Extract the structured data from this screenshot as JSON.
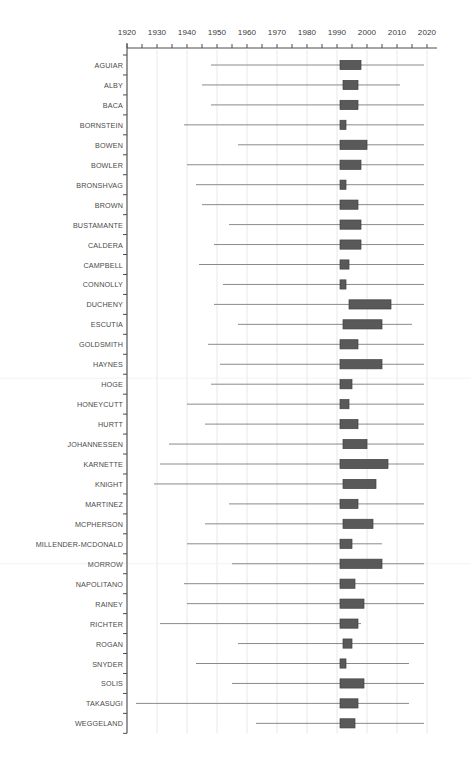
{
  "figure": {
    "title": "",
    "type_note": "box-and-whisker strip chart",
    "axis": {
      "x_label": "",
      "x_ticks": [
        1920,
        1930,
        1940,
        1950,
        1960,
        1970,
        1980,
        1990,
        2000,
        2010,
        2020
      ],
      "x_minor_step": 5,
      "x_min": 1920,
      "x_max": 2025,
      "grid": "vertical light gray at major ticks",
      "tick_position": "top"
    },
    "colors": {
      "box_fill": "#595959",
      "box_edge": "#404040",
      "whisker": "#8a8a8a",
      "axis": "#4d4d4d",
      "grid": "#e2e2e2",
      "label_text": "#4a4a4a",
      "tick_text": "#3a3a3a"
    }
  },
  "chart_data": {
    "type": "box",
    "title": "",
    "xlabel": "",
    "ylabel": "",
    "xlim": [
      1920,
      2025
    ],
    "grid": true,
    "legend": "none",
    "categories": [
      "AGUIAR",
      "ALBY",
      "BACA",
      "BORNSTEIN",
      "BOWEN",
      "BOWLER",
      "BRONSHVAG",
      "BROWN",
      "BUSTAMANTE",
      "CALDERA",
      "CAMPBELL",
      "CONNOLLY",
      "DUCHENY",
      "ESCUTIA",
      "GOLDSMITH",
      "HAYNES",
      "HOGE",
      "HONEYCUTT",
      "HURTT",
      "JOHANNESSEN",
      "KARNETTE",
      "KNIGHT",
      "MARTINEZ",
      "MCPHERSON",
      "MILLENDER-MCDONALD",
      "MORROW",
      "NAPOLITANO",
      "RAINEY",
      "RICHTER",
      "ROGAN",
      "SNYDER",
      "SOLIS",
      "TAKASUGI",
      "WEGGELAND"
    ],
    "boxes": [
      {
        "label": "AGUIAR",
        "whisker_low": 1948,
        "box_low": 1991,
        "box_high": 1998,
        "whisker_high": 2019
      },
      {
        "label": "ALBY",
        "whisker_low": 1945,
        "box_low": 1992,
        "box_high": 1997,
        "whisker_high": 2011
      },
      {
        "label": "BACA",
        "whisker_low": 1948,
        "box_low": 1991,
        "box_high": 1997,
        "whisker_high": 2019
      },
      {
        "label": "BORNSTEIN",
        "whisker_low": 1939,
        "box_low": 1991,
        "box_high": 1993,
        "whisker_high": 2019
      },
      {
        "label": "BOWEN",
        "whisker_low": 1957,
        "box_low": 1991,
        "box_high": 2000,
        "whisker_high": 2019
      },
      {
        "label": "BOWLER",
        "whisker_low": 1940,
        "box_low": 1991,
        "box_high": 1998,
        "whisker_high": 2019
      },
      {
        "label": "BRONSHVAG",
        "whisker_low": 1943,
        "box_low": 1991,
        "box_high": 1993,
        "whisker_high": 2019
      },
      {
        "label": "BROWN",
        "whisker_low": 1945,
        "box_low": 1991,
        "box_high": 1997,
        "whisker_high": 2019
      },
      {
        "label": "BUSTAMANTE",
        "whisker_low": 1954,
        "box_low": 1991,
        "box_high": 1998,
        "whisker_high": 2019
      },
      {
        "label": "CALDERA",
        "whisker_low": 1949,
        "box_low": 1991,
        "box_high": 1998,
        "whisker_high": 2019
      },
      {
        "label": "CAMPBELL",
        "whisker_low": 1944,
        "box_low": 1991,
        "box_high": 1994,
        "whisker_high": 2019
      },
      {
        "label": "CONNOLLY",
        "whisker_low": 1952,
        "box_low": 1991,
        "box_high": 1993,
        "whisker_high": 2019
      },
      {
        "label": "DUCHENY",
        "whisker_low": 1949,
        "box_low": 1994,
        "box_high": 2008,
        "whisker_high": 2019
      },
      {
        "label": "ESCUTIA",
        "whisker_low": 1957,
        "box_low": 1992,
        "box_high": 2005,
        "whisker_high": 2015
      },
      {
        "label": "GOLDSMITH",
        "whisker_low": 1947,
        "box_low": 1991,
        "box_high": 1997,
        "whisker_high": 2019
      },
      {
        "label": "HAYNES",
        "whisker_low": 1951,
        "box_low": 1991,
        "box_high": 2005,
        "whisker_high": 2019
      },
      {
        "label": "HOGE",
        "whisker_low": 1948,
        "box_low": 1991,
        "box_high": 1995,
        "whisker_high": 2019
      },
      {
        "label": "HONEYCUTT",
        "whisker_low": 1940,
        "box_low": 1991,
        "box_high": 1994,
        "whisker_high": 2019
      },
      {
        "label": "HURTT",
        "whisker_low": 1946,
        "box_low": 1991,
        "box_high": 1997,
        "whisker_high": 2019
      },
      {
        "label": "JOHANNESSEN",
        "whisker_low": 1934,
        "box_low": 1992,
        "box_high": 2000,
        "whisker_high": 2019
      },
      {
        "label": "KARNETTE",
        "whisker_low": 1931,
        "box_low": 1991,
        "box_high": 2007,
        "whisker_high": 2019
      },
      {
        "label": "KNIGHT",
        "whisker_low": 1929,
        "box_low": 1992,
        "box_high": 2003,
        "whisker_high": 2003
      },
      {
        "label": "MARTINEZ",
        "whisker_low": 1954,
        "box_low": 1991,
        "box_high": 1997,
        "whisker_high": 2019
      },
      {
        "label": "MCPHERSON",
        "whisker_low": 1946,
        "box_low": 1992,
        "box_high": 2002,
        "whisker_high": 2019
      },
      {
        "label": "MILLENDER-MCDONALD",
        "whisker_low": 1940,
        "box_low": 1991,
        "box_high": 1995,
        "whisker_high": 2005
      },
      {
        "label": "MORROW",
        "whisker_low": 1955,
        "box_low": 1991,
        "box_high": 2005,
        "whisker_high": 2019
      },
      {
        "label": "NAPOLITANO",
        "whisker_low": 1939,
        "box_low": 1991,
        "box_high": 1996,
        "whisker_high": 2019
      },
      {
        "label": "RAINEY",
        "whisker_low": 1940,
        "box_low": 1991,
        "box_high": 1999,
        "whisker_high": 2019
      },
      {
        "label": "RICHTER",
        "whisker_low": 1931,
        "box_low": 1991,
        "box_high": 1997,
        "whisker_high": 1998
      },
      {
        "label": "ROGAN",
        "whisker_low": 1957,
        "box_low": 1992,
        "box_high": 1995,
        "whisker_high": 2019
      },
      {
        "label": "SNYDER",
        "whisker_low": 1943,
        "box_low": 1991,
        "box_high": 1993,
        "whisker_high": 2014
      },
      {
        "label": "SOLIS",
        "whisker_low": 1955,
        "box_low": 1991,
        "box_high": 1999,
        "whisker_high": 2019
      },
      {
        "label": "TAKASUGI",
        "whisker_low": 1923,
        "box_low": 1991,
        "box_high": 1997,
        "whisker_high": 2014
      },
      {
        "label": "WEGGELAND",
        "whisker_low": 1963,
        "box_low": 1991,
        "box_high": 1996,
        "whisker_high": 2019
      }
    ]
  }
}
